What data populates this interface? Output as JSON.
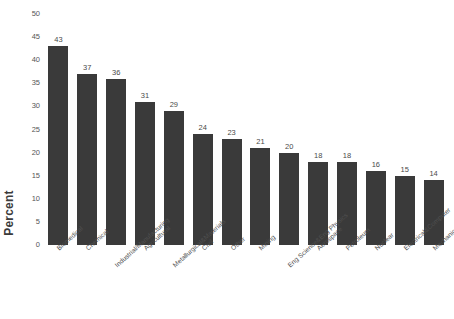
{
  "chart_data": {
    "type": "bar",
    "title": "",
    "xlabel": "",
    "ylabel": "Percent",
    "ylim": [
      0,
      50
    ],
    "ytick_step": 5,
    "grid": false,
    "legend": false,
    "bar_color": "#3a3a3a",
    "background_color": "#ffffff",
    "value_labels": true,
    "xtick_rotation": -42,
    "yticks": [
      0,
      5,
      10,
      15,
      20,
      25,
      30,
      35,
      40,
      45,
      50
    ],
    "categories": [
      "Biomedical",
      "Chemical",
      "Industrial/Manufacturing",
      "Agricultural",
      "Metallurgical&Materials",
      "Civil",
      "Other",
      "Mining",
      "Eng Science&Eng Physics",
      "Aerospace",
      "Petroleum",
      "Nuclear",
      "Electrical&Computer",
      "Mechanical"
    ],
    "values": [
      43,
      37,
      36,
      31,
      29,
      24,
      23,
      21,
      20,
      18,
      18,
      16,
      15,
      14
    ]
  }
}
